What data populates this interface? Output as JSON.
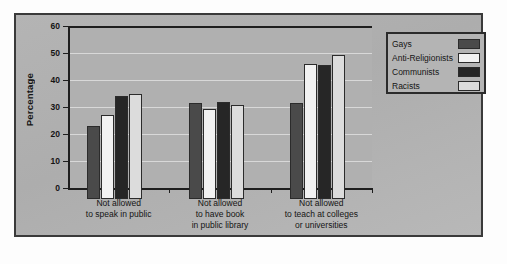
{
  "chart_data": {
    "type": "bar",
    "title": "",
    "xlabel": "",
    "ylabel": "Percentage",
    "ylim": [
      0,
      60
    ],
    "ytick_values": [
      0,
      10,
      20,
      30,
      40,
      50,
      60
    ],
    "ytick_labels": [
      "0",
      "10",
      "20",
      "30",
      "40",
      "50",
      "60"
    ],
    "grid": true,
    "legend_position": "top-right",
    "categories": [
      "Not allowed\nto speak in public",
      "Not allowed\nto have book\nin public library",
      "Not allowed\nto teach at colleges\nor universities"
    ],
    "series": [
      {
        "name": "Gays",
        "color": "#4a4a4a",
        "values": [
          27,
          35.5,
          35.5
        ]
      },
      {
        "name": "Anti-Religionists",
        "color": "#f2f2f2",
        "values": [
          31,
          33.5,
          50
        ]
      },
      {
        "name": "Communists",
        "color": "#262626",
        "values": [
          38,
          36,
          49.5
        ]
      },
      {
        "name": "Racists",
        "color": "#dcdcdc",
        "values": [
          39,
          35,
          53.5
        ]
      }
    ]
  },
  "legend": {
    "items": [
      {
        "label": "Gays",
        "color": "#4a4a4a"
      },
      {
        "label": "Anti-Religionists",
        "color": "#f2f2f2"
      },
      {
        "label": "Communists",
        "color": "#262626"
      },
      {
        "label": "Racists",
        "color": "#dcdcdc"
      }
    ]
  },
  "axis": {
    "y_title": "Percentage",
    "y_labels": [
      "60",
      "50",
      "40",
      "30",
      "20",
      "10",
      "0"
    ]
  },
  "x_axis": {
    "labels": [
      "Not allowed\nto speak in public",
      "Not allowed\nto have book\nin public library",
      "Not allowed\nto teach at colleges\nor universities"
    ]
  }
}
